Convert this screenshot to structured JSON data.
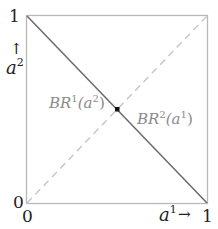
{
  "diagram": {
    "y_axis": {
      "label": "a",
      "label_sup": "2",
      "arrow": "↑",
      "top_tick": "1",
      "bottom_tick": "0"
    },
    "x_axis": {
      "label": "a",
      "label_sup": "1",
      "arrow": "→",
      "left_tick": "0",
      "right_tick": "1"
    },
    "curves": [
      {
        "name": "BR1",
        "label": "BR",
        "sup": "1",
        "arg": "(a",
        "arg_sup": "2",
        "close": ")",
        "style": "dashed",
        "from": [
          0,
          0
        ],
        "to": [
          1,
          1
        ]
      },
      {
        "name": "BR2",
        "label": "BR",
        "sup": "2",
        "arg": "(a",
        "arg_sup": "1",
        "close": ")",
        "style": "solid",
        "from": [
          0,
          1
        ],
        "to": [
          1,
          0
        ]
      }
    ],
    "equilibrium": {
      "x": 0.5,
      "y": 0.5
    },
    "colors": {
      "frame": "#b8b8b8",
      "solid_line": "#6a6a6a",
      "dashed_line": "#c8c8c8",
      "curve_label": "#8a8a8a",
      "axis_text": "#222222",
      "dot": "#111111"
    }
  }
}
